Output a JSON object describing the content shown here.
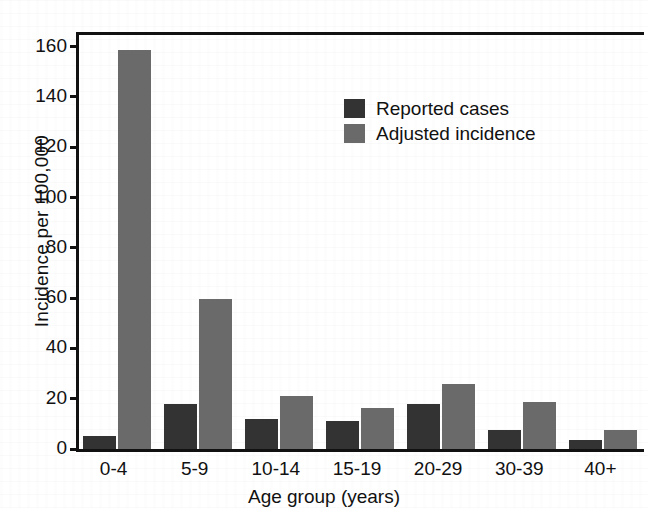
{
  "chart_data": {
    "type": "bar",
    "title": "",
    "xlabel": "Age group (years)",
    "ylabel": "Incidence per 100,000",
    "categories": [
      "0-4",
      "5-9",
      "10-14",
      "15-19",
      "20-29",
      "30-39",
      "40+"
    ],
    "series": [
      {
        "name": "Reported cases",
        "color": "#333333",
        "values": [
          5,
          18,
          12,
          11,
          18,
          7.5,
          3.5
        ]
      },
      {
        "name": "Adjusted incidence",
        "color": "#6a6a6a",
        "values": [
          158.5,
          59.5,
          21,
          16.5,
          26,
          18.5,
          7.5
        ]
      }
    ],
    "ylim": [
      0,
      167
    ],
    "yticks": [
      0,
      20,
      40,
      60,
      80,
      100,
      120,
      140,
      160
    ],
    "ytick_labels": [
      "0",
      "20",
      "40",
      "60",
      "80",
      "100",
      "120",
      "140",
      "160"
    ],
    "grid": false,
    "legend_position": "upper-center",
    "legend": [
      {
        "label": "Reported cases",
        "color": "#333333"
      },
      {
        "label": "Adjusted incidence",
        "color": "#6a6a6a"
      }
    ]
  }
}
